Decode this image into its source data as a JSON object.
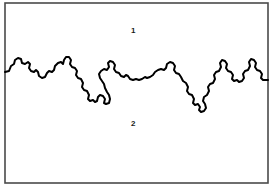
{
  "figure": {
    "background_color": "#ffffff",
    "frame": {
      "name": "plot-border",
      "x": 5,
      "y": 3,
      "width": 263,
      "height": 180,
      "stroke_color": "#4a4a4a",
      "stroke_width": 1.6,
      "fill_color": "#ffffff"
    },
    "labels": [
      {
        "id": "1",
        "text": "1",
        "x": 131,
        "y": 27,
        "color": "#1a1a1a",
        "font_size": 8,
        "font_weight": "bold",
        "region": "upper"
      },
      {
        "id": "2",
        "text": "2",
        "x": 131,
        "y": 120,
        "color": "#1a1a1a",
        "font_size": 8,
        "font_weight": "bold",
        "region": "lower"
      }
    ],
    "boundary_curve": {
      "name": "fractal-boundary-curve",
      "stroke_color": "#000000",
      "stroke_width": 2.0,
      "fill": "none",
      "line_join": "round",
      "line_cap": "round",
      "description": "Jagged self-similar coastline-like interface running left to right across the frame, separating region 1 (above) from region 2 (below).",
      "start_point": [
        5,
        72
      ],
      "end_point": [
        268,
        80
      ],
      "points": [
        [
          5,
          72
        ],
        [
          9,
          71
        ],
        [
          11,
          66
        ],
        [
          14,
          64
        ],
        [
          15,
          60
        ],
        [
          18,
          58
        ],
        [
          21,
          59
        ],
        [
          22,
          63
        ],
        [
          25,
          64
        ],
        [
          28,
          62
        ],
        [
          30,
          64
        ],
        [
          29,
          68
        ],
        [
          31,
          71
        ],
        [
          34,
          72
        ],
        [
          36,
          70
        ],
        [
          38,
          72
        ],
        [
          39,
          76
        ],
        [
          42,
          78
        ],
        [
          45,
          77
        ],
        [
          47,
          73
        ],
        [
          49,
          71
        ],
        [
          52,
          72
        ],
        [
          54,
          70
        ],
        [
          55,
          66
        ],
        [
          58,
          63
        ],
        [
          61,
          62
        ],
        [
          63,
          64
        ],
        [
          64,
          60
        ],
        [
          66,
          57
        ],
        [
          69,
          57
        ],
        [
          71,
          60
        ],
        [
          70,
          64
        ],
        [
          72,
          67
        ],
        [
          75,
          68
        ],
        [
          77,
          71
        ],
        [
          76,
          75
        ],
        [
          78,
          78
        ],
        [
          81,
          79
        ],
        [
          83,
          83
        ],
        [
          82,
          87
        ],
        [
          84,
          90
        ],
        [
          87,
          91
        ],
        [
          89,
          95
        ],
        [
          88,
          99
        ],
        [
          90,
          101
        ],
        [
          93,
          100
        ],
        [
          95,
          102
        ],
        [
          97,
          101
        ],
        [
          98,
          97
        ],
        [
          100,
          95
        ],
        [
          103,
          96
        ],
        [
          105,
          99
        ],
        [
          104,
          103
        ],
        [
          106,
          104
        ],
        [
          109,
          103
        ],
        [
          110,
          99
        ],
        [
          109,
          95
        ],
        [
          107,
          92
        ],
        [
          105,
          88
        ],
        [
          104,
          84
        ],
        [
          102,
          81
        ],
        [
          100,
          78
        ],
        [
          99,
          74
        ],
        [
          101,
          71
        ],
        [
          104,
          69
        ],
        [
          107,
          70
        ],
        [
          109,
          67
        ],
        [
          108,
          63
        ],
        [
          110,
          61
        ],
        [
          113,
          62
        ],
        [
          115,
          65
        ],
        [
          114,
          69
        ],
        [
          116,
          72
        ],
        [
          119,
          73
        ],
        [
          121,
          76
        ],
        [
          124,
          77
        ],
        [
          126,
          75
        ],
        [
          128,
          76
        ],
        [
          130,
          79
        ],
        [
          133,
          80
        ],
        [
          136,
          79
        ],
        [
          139,
          80
        ],
        [
          142,
          79
        ],
        [
          145,
          77
        ],
        [
          147,
          78
        ],
        [
          150,
          77
        ],
        [
          153,
          75
        ],
        [
          155,
          72
        ],
        [
          158,
          70
        ],
        [
          161,
          69
        ],
        [
          164,
          70
        ],
        [
          166,
          68
        ],
        [
          167,
          64
        ],
        [
          170,
          62
        ],
        [
          173,
          63
        ],
        [
          175,
          66
        ],
        [
          174,
          70
        ],
        [
          176,
          73
        ],
        [
          179,
          74
        ],
        [
          181,
          77
        ],
        [
          183,
          81
        ],
        [
          186,
          83
        ],
        [
          188,
          87
        ],
        [
          187,
          91
        ],
        [
          189,
          94
        ],
        [
          192,
          95
        ],
        [
          194,
          99
        ],
        [
          193,
          103
        ],
        [
          195,
          105
        ],
        [
          198,
          104
        ],
        [
          200,
          107
        ],
        [
          199,
          110
        ],
        [
          201,
          112
        ],
        [
          204,
          111
        ],
        [
          206,
          108
        ],
        [
          205,
          104
        ],
        [
          203,
          101
        ],
        [
          204,
          97
        ],
        [
          207,
          95
        ],
        [
          209,
          91
        ],
        [
          208,
          87
        ],
        [
          210,
          84
        ],
        [
          213,
          83
        ],
        [
          215,
          79
        ],
        [
          214,
          75
        ],
        [
          216,
          72
        ],
        [
          219,
          71
        ],
        [
          221,
          67
        ],
        [
          220,
          63
        ],
        [
          222,
          60
        ],
        [
          225,
          61
        ],
        [
          227,
          64
        ],
        [
          226,
          68
        ],
        [
          228,
          71
        ],
        [
          231,
          72
        ],
        [
          233,
          75
        ],
        [
          232,
          79
        ],
        [
          234,
          81
        ],
        [
          237,
          80
        ],
        [
          239,
          82
        ],
        [
          242,
          81
        ],
        [
          244,
          78
        ],
        [
          243,
          74
        ],
        [
          245,
          71
        ],
        [
          248,
          70
        ],
        [
          250,
          66
        ],
        [
          249,
          62
        ],
        [
          251,
          59
        ],
        [
          254,
          60
        ],
        [
          256,
          63
        ],
        [
          255,
          67
        ],
        [
          257,
          70
        ],
        [
          260,
          71
        ],
        [
          262,
          74
        ],
        [
          261,
          78
        ],
        [
          263,
          80
        ],
        [
          268,
          80
        ]
      ]
    }
  }
}
